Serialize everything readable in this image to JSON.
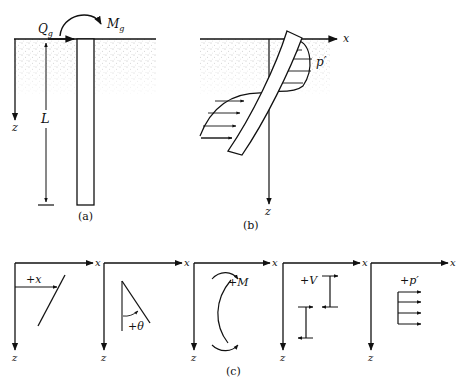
{
  "figure_a": {
    "caption": "(a)",
    "labels": {
      "shear": "Q",
      "shear_sub": "g",
      "moment": "M",
      "moment_sub": "g",
      "length": "L",
      "depth_axis": "z"
    }
  },
  "figure_b": {
    "caption": "(b)",
    "labels": {
      "x_axis": "x",
      "z_axis": "z",
      "pressure": "p′"
    }
  },
  "figure_c": {
    "caption": "(c)",
    "panels": [
      {
        "label": "+x",
        "x_axis": "x",
        "z_axis": "z"
      },
      {
        "label": "+θ",
        "x_axis": "x",
        "z_axis": "z"
      },
      {
        "label": "+M",
        "x_axis": "x",
        "z_axis": "z"
      },
      {
        "label": "+V",
        "x_axis": "x",
        "z_axis": "z"
      },
      {
        "label": "+p′",
        "x_axis": "x",
        "z_axis": "z"
      }
    ]
  },
  "colors": {
    "ink": "#111111",
    "soil": "#8a8a8a"
  }
}
